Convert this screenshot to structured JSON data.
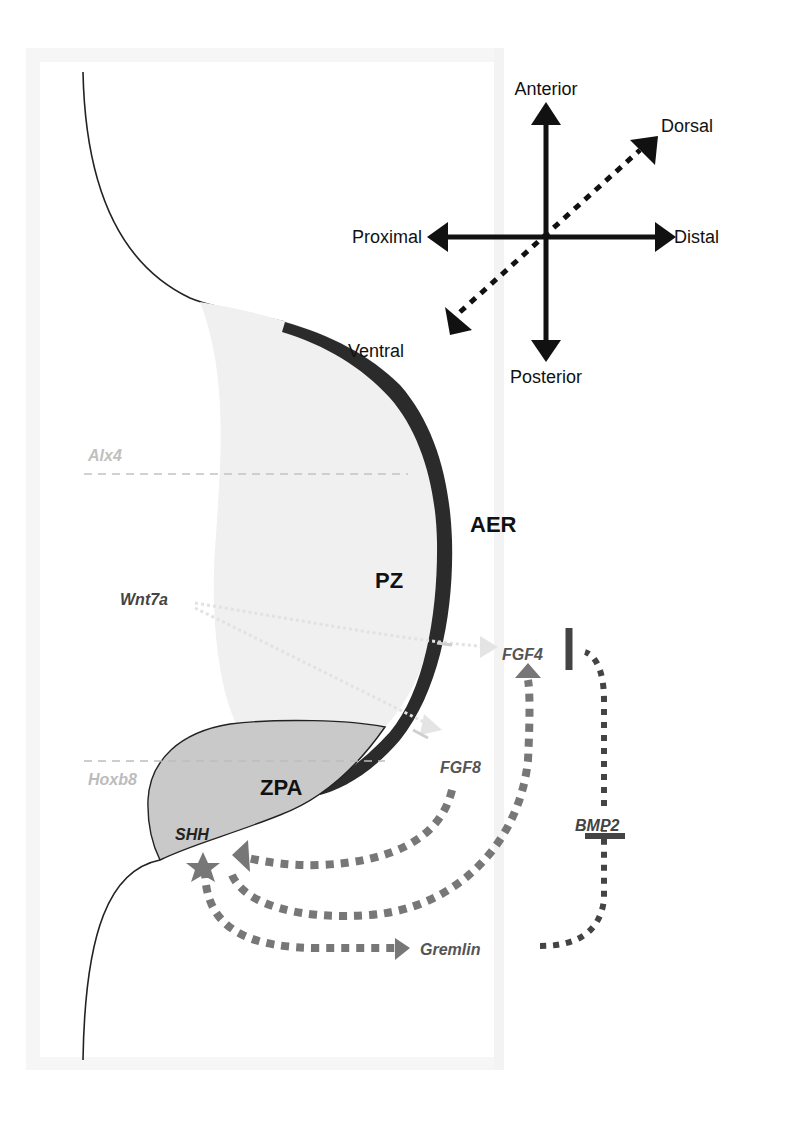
{
  "figure": {
    "axes": {
      "anterior": "Anterior",
      "posterior": "Posterior",
      "proximal": "Proximal",
      "distal": "Distal",
      "dorsal": "Dorsal",
      "ventral": "Ventral"
    },
    "regions": {
      "aer": "AER",
      "pz": "PZ",
      "zpa": "ZPA"
    },
    "genes": {
      "alx4": "Alx4",
      "hoxb8": "Hoxb8",
      "wnt7a": "Wnt7a",
      "fgf4": "FGF4",
      "fgf8": "FGF8",
      "shh": "SHH",
      "bmp2": "BMP2",
      "gremlin": "Gremlin"
    },
    "colors": {
      "ink": "#111111",
      "aer": "#2b2b2b",
      "pz_fill": "#efefef",
      "zpa_fill": "#c9c9c9",
      "signal_gray": "#777777",
      "signal_dark": "#444444",
      "faint": "#bbbbbb",
      "frame": "#f5f5f5"
    }
  }
}
